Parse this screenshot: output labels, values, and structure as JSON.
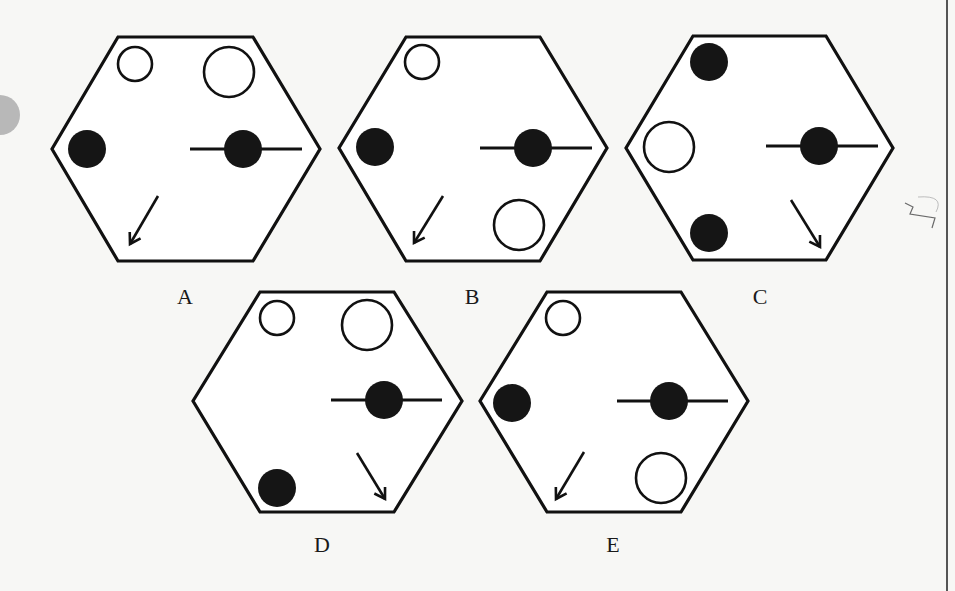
{
  "figure": {
    "stroke_color": "#111111",
    "fill_color": "#151515",
    "background_color": "#f7f7f5",
    "options": [
      {
        "label": "A",
        "label_pos": [
          185,
          297
        ],
        "hexagon": [
          [
            118,
            37
          ],
          [
            253,
            37
          ],
          [
            320,
            149
          ],
          [
            253,
            261
          ],
          [
            118,
            261
          ],
          [
            52,
            149
          ]
        ],
        "open_circles": [
          {
            "cx": 135,
            "cy": 64,
            "r": 17
          },
          {
            "cx": 229,
            "cy": 72,
            "r": 25
          }
        ],
        "filled_circles": [
          {
            "cx": 87,
            "cy": 149,
            "r": 19
          }
        ],
        "bar_circle": {
          "cx": 243,
          "cy": 149,
          "r": 19,
          "x1": 190,
          "x2": 302
        },
        "arrow": {
          "x1": 158,
          "y1": 196,
          "x2": 130,
          "y2": 244
        }
      },
      {
        "label": "B",
        "label_pos": [
          472,
          297
        ],
        "hexagon": [
          [
            406,
            37
          ],
          [
            540,
            37
          ],
          [
            607,
            148
          ],
          [
            540,
            261
          ],
          [
            406,
            261
          ],
          [
            339,
            148
          ]
        ],
        "open_circles": [
          {
            "cx": 422,
            "cy": 62,
            "r": 17
          },
          {
            "cx": 519,
            "cy": 225,
            "r": 25
          }
        ],
        "filled_circles": [
          {
            "cx": 375,
            "cy": 147,
            "r": 19
          }
        ],
        "bar_circle": {
          "cx": 533,
          "cy": 148,
          "r": 19,
          "x1": 480,
          "x2": 592
        },
        "arrow": {
          "x1": 443,
          "y1": 196,
          "x2": 414,
          "y2": 243
        }
      },
      {
        "label": "C",
        "label_pos": [
          760,
          297
        ],
        "hexagon": [
          [
            693,
            36
          ],
          [
            826,
            36
          ],
          [
            893,
            148
          ],
          [
            826,
            260
          ],
          [
            693,
            260
          ],
          [
            626,
            148
          ]
        ],
        "open_circles": [
          {
            "cx": 669,
            "cy": 147,
            "r": 25
          }
        ],
        "filled_circles": [
          {
            "cx": 709,
            "cy": 62,
            "r": 19
          },
          {
            "cx": 709,
            "cy": 233,
            "r": 19
          }
        ],
        "bar_circle": {
          "cx": 819,
          "cy": 146,
          "r": 19,
          "x1": 766,
          "x2": 878
        },
        "arrow": {
          "x1": 791,
          "y1": 200,
          "x2": 820,
          "y2": 247
        }
      },
      {
        "label": "D",
        "label_pos": [
          322,
          545
        ],
        "hexagon": [
          [
            260,
            292
          ],
          [
            394,
            292
          ],
          [
            462,
            401
          ],
          [
            394,
            512
          ],
          [
            260,
            512
          ],
          [
            193,
            401
          ]
        ],
        "open_circles": [
          {
            "cx": 277,
            "cy": 318,
            "r": 17
          },
          {
            "cx": 367,
            "cy": 325,
            "r": 25
          }
        ],
        "filled_circles": [
          {
            "cx": 277,
            "cy": 488,
            "r": 19
          }
        ],
        "bar_circle": {
          "cx": 384,
          "cy": 400,
          "r": 19,
          "x1": 331,
          "x2": 442
        },
        "arrow": {
          "x1": 357,
          "y1": 453,
          "x2": 385,
          "y2": 499
        }
      },
      {
        "label": "E",
        "label_pos": [
          613,
          545
        ],
        "hexagon": [
          [
            547,
            292
          ],
          [
            681,
            292
          ],
          [
            748,
            401
          ],
          [
            681,
            512
          ],
          [
            547,
            512
          ],
          [
            480,
            401
          ]
        ],
        "open_circles": [
          {
            "cx": 563,
            "cy": 318,
            "r": 17
          },
          {
            "cx": 661,
            "cy": 478,
            "r": 25
          }
        ],
        "filled_circles": [
          {
            "cx": 512,
            "cy": 403,
            "r": 19
          }
        ],
        "bar_circle": {
          "cx": 669,
          "cy": 401,
          "r": 19,
          "x1": 617,
          "x2": 728
        },
        "arrow": {
          "x1": 584,
          "y1": 452,
          "x2": 556,
          "y2": 499
        }
      }
    ]
  },
  "annotations": {
    "pencil_mark": "handwritten squiggle near right margin"
  }
}
